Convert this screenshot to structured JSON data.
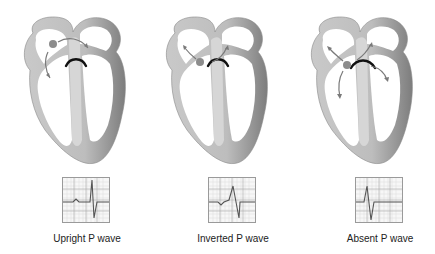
{
  "diagram": {
    "panels": [
      {
        "id": "upright",
        "caption": "Upright P wave",
        "pacemaker_location": "high right atrium",
        "conduction_arrows": [
          "to-left-atrium",
          "down-right-atrium"
        ],
        "ecg": {
          "p_wave": "upright",
          "qrs": "normal"
        }
      },
      {
        "id": "inverted",
        "caption": "Inverted P wave",
        "pacemaker_location": "low right atrium near AV node",
        "conduction_arrows": [
          "up-right-atrium",
          "up-left-atrium"
        ],
        "ecg": {
          "p_wave": "inverted",
          "qrs": "normal"
        }
      },
      {
        "id": "absent",
        "caption": "Absent P wave",
        "pacemaker_location": "AV junction",
        "conduction_arrows": [
          "up-right-atrium",
          "up-left-atrium",
          "down-right-ventricle",
          "down-left-ventricle"
        ],
        "ecg": {
          "p_wave": "absent",
          "qrs": "normal"
        }
      }
    ],
    "colors": {
      "heart_wall": "#b5b5b5",
      "heart_wall_dark": "#8a8a8a",
      "pacemaker_dot": "#8c8c8c",
      "arrow": "#7a7a7a",
      "av_arc": "#111111",
      "ecg_grid": "#c8c8c8",
      "ecg_trace": "#555555"
    }
  }
}
